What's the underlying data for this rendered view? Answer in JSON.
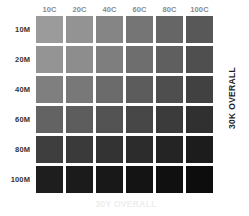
{
  "chart_data": {
    "type": "heatmap",
    "xlabel": "30Y OVERALL",
    "ylabel": "30K OVERALL",
    "grid": false,
    "legend_position": "none",
    "x": [
      "10C",
      "20C",
      "40C",
      "60C",
      "80C",
      "100C"
    ],
    "y": [
      "10M",
      "20M",
      "40M",
      "60M",
      "80M",
      "100M"
    ],
    "x_values": [
      10,
      20,
      40,
      60,
      80,
      100
    ],
    "y_values": [
      10,
      20,
      40,
      60,
      80,
      100
    ],
    "x_unit": "C",
    "y_unit": "M",
    "base_inks": {
      "K": 30,
      "Y": 30
    },
    "cells": [
      {
        "row": "10M",
        "patches": [
          {
            "label": "10C 10M",
            "c": 10,
            "m": 10,
            "color": "#9b9b9b"
          },
          {
            "label": "20C 10M",
            "c": 20,
            "m": 10,
            "color": "#939393"
          },
          {
            "label": "40C 10M",
            "c": 40,
            "m": 10,
            "color": "#858585"
          },
          {
            "label": "60C 10M",
            "c": 60,
            "m": 10,
            "color": "#757575"
          },
          {
            "label": "80C 10M",
            "c": 80,
            "m": 10,
            "color": "#666666"
          },
          {
            "label": "100C 10M",
            "c": 100,
            "m": 10,
            "color": "#585858"
          }
        ]
      },
      {
        "row": "20M",
        "patches": [
          {
            "label": "10C 20M",
            "c": 10,
            "m": 20,
            "color": "#949494"
          },
          {
            "label": "20C 20M",
            "c": 20,
            "m": 20,
            "color": "#8d8d8d"
          },
          {
            "label": "40C 20M",
            "c": 40,
            "m": 20,
            "color": "#7e7e7e"
          },
          {
            "label": "60C 20M",
            "c": 60,
            "m": 20,
            "color": "#6e6e6e"
          },
          {
            "label": "80C 20M",
            "c": 80,
            "m": 20,
            "color": "#5f5f5f"
          },
          {
            "label": "100C 20M",
            "c": 100,
            "m": 20,
            "color": "#4f4f4f"
          }
        ]
      },
      {
        "row": "40M",
        "patches": [
          {
            "label": "10C 40M",
            "c": 10,
            "m": 40,
            "color": "#7f7f7f"
          },
          {
            "label": "20C 40M",
            "c": 20,
            "m": 40,
            "color": "#787878"
          },
          {
            "label": "40C 40M",
            "c": 40,
            "m": 40,
            "color": "#6b6b6b"
          },
          {
            "label": "60C 40M",
            "c": 60,
            "m": 40,
            "color": "#5c5c5c"
          },
          {
            "label": "80C 40M",
            "c": 80,
            "m": 40,
            "color": "#4e4e4e"
          },
          {
            "label": "100C 40M",
            "c": 100,
            "m": 40,
            "color": "#414141"
          }
        ]
      },
      {
        "row": "60M",
        "patches": [
          {
            "label": "10C 60M",
            "c": 10,
            "m": 60,
            "color": "#636363"
          },
          {
            "label": "20C 60M",
            "c": 20,
            "m": 60,
            "color": "#5d5d5d"
          },
          {
            "label": "40C 60M",
            "c": 40,
            "m": 60,
            "color": "#535353"
          },
          {
            "label": "60C 60M",
            "c": 60,
            "m": 60,
            "color": "#474747"
          },
          {
            "label": "80C 60M",
            "c": 80,
            "m": 60,
            "color": "#3b3b3b"
          },
          {
            "label": "100C 60M",
            "c": 100,
            "m": 60,
            "color": "#303030"
          }
        ]
      },
      {
        "row": "80M",
        "patches": [
          {
            "label": "10C 80M",
            "c": 10,
            "m": 80,
            "color": "#3e3e3e"
          },
          {
            "label": "20C 80M",
            "c": 20,
            "m": 80,
            "color": "#3a3a3a"
          },
          {
            "label": "40C 80M",
            "c": 40,
            "m": 80,
            "color": "#333333"
          },
          {
            "label": "60C 80M",
            "c": 60,
            "m": 80,
            "color": "#2c2c2c"
          },
          {
            "label": "80C 80M",
            "c": 80,
            "m": 80,
            "color": "#242424"
          },
          {
            "label": "100C 80M",
            "c": 100,
            "m": 80,
            "color": "#1c1c1c"
          }
        ]
      },
      {
        "row": "100M",
        "patches": [
          {
            "label": "10C 100M",
            "c": 10,
            "m": 100,
            "color": "#1e1e1e"
          },
          {
            "label": "20C 100M",
            "c": 20,
            "m": 100,
            "color": "#1b1b1b"
          },
          {
            "label": "40C 100M",
            "c": 40,
            "m": 100,
            "color": "#181818"
          },
          {
            "label": "60C 100M",
            "c": 60,
            "m": 100,
            "color": "#141414"
          },
          {
            "label": "80C 100M",
            "c": 80,
            "m": 100,
            "color": "#101010"
          },
          {
            "label": "100C 100M",
            "c": 100,
            "m": 100,
            "color": "#0d0d0d"
          }
        ]
      }
    ]
  },
  "axes": {
    "right_label": "30K OVERALL",
    "bottom_label": "30Y OVERALL"
  },
  "colors": {
    "background": "#ffffff",
    "column_header_text": "#8a8a8a",
    "row_header_text": "#333333",
    "right_label_text": "#1f1f1f",
    "bottom_label_text": "#ededed"
  }
}
